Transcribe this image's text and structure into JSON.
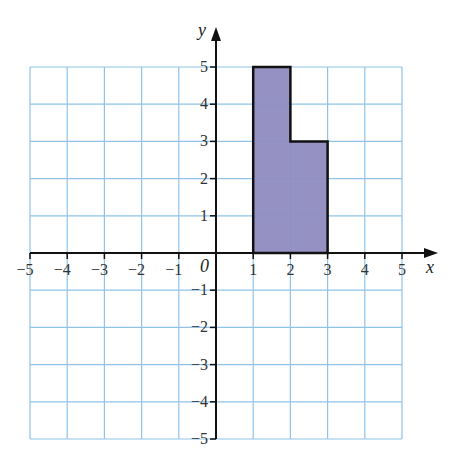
{
  "chart_data": {
    "type": "diagram",
    "title": "",
    "xlabel": "x",
    "ylabel": "y",
    "origin_label": "0",
    "xlim": [
      -5,
      5
    ],
    "ylim": [
      -5,
      5
    ],
    "grid": true,
    "x_ticks": [
      -5,
      -4,
      -3,
      -2,
      -1,
      1,
      2,
      3,
      4,
      5
    ],
    "y_ticks": [
      -5,
      -4,
      -3,
      -2,
      -1,
      1,
      2,
      3,
      4,
      5
    ],
    "x_tick_labels": [
      "−5",
      "−4",
      "−3",
      "−2",
      "−1",
      "1",
      "2",
      "3",
      "4",
      "5"
    ],
    "y_tick_labels": [
      "−5",
      "−4",
      "−3",
      "−2",
      "−1",
      "1",
      "2",
      "3",
      "4",
      "5"
    ],
    "shape": {
      "name": "L-shaped polygon",
      "vertices": [
        [
          1,
          0
        ],
        [
          1,
          5
        ],
        [
          2,
          5
        ],
        [
          2,
          3
        ],
        [
          3,
          3
        ],
        [
          3,
          0
        ]
      ],
      "fill": "#8f8cc0",
      "stroke": "#111111"
    }
  },
  "colors": {
    "grid": "#8fc3ea",
    "axis": "#111111",
    "fill": "#8f8cc0"
  }
}
